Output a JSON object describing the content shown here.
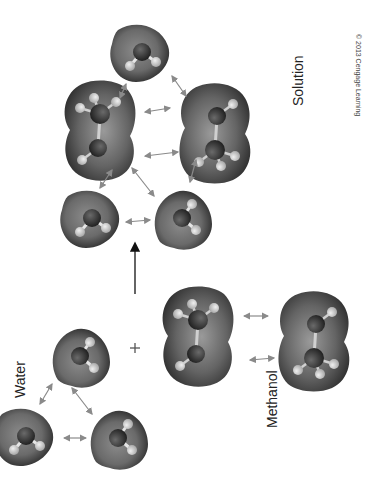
{
  "diagram": {
    "labels": {
      "water": "Water",
      "methanol": "Methanol",
      "solution": "Solution",
      "plus": "+",
      "copyright": "© 2013 Cengage Learning"
    },
    "groups": [
      {
        "name": "water",
        "molecules": [
          "water",
          "water",
          "water"
        ]
      },
      {
        "name": "methanol",
        "molecules": [
          "methanol",
          "methanol"
        ]
      },
      {
        "name": "solution",
        "molecules": [
          "water",
          "methanol",
          "methanol",
          "water",
          "water"
        ]
      }
    ],
    "relations": [
      {
        "type": "reaction-arrow",
        "from": "mixture",
        "to": "solution"
      },
      {
        "type": "hydrogen-bond",
        "style": "double-headed-arrow"
      }
    ],
    "colors": {
      "surface_dark": "#2e2e2e",
      "surface_mid": "#7a7a7a",
      "surface_light": "#bdbdbd",
      "atom_heavy": "#3d3d3d",
      "atom_h": "#d8d8d8",
      "bond_arrow": "#8a8a8a"
    }
  }
}
